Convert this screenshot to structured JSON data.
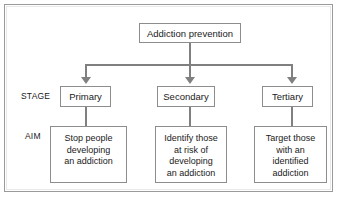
{
  "diagram": {
    "root": {
      "label": "Addiction prevention"
    },
    "row_labels": {
      "stage": "STAGE",
      "aim": "AIM"
    },
    "branches": [
      {
        "stage": "Primary",
        "aim_lines": [
          "Stop people",
          "developing",
          "an addiction"
        ]
      },
      {
        "stage": "Secondary",
        "aim_lines": [
          "Identify those",
          "at risk of",
          "developing",
          "an addiction"
        ]
      },
      {
        "stage": "Tertiary",
        "aim_lines": [
          "Target those",
          "with an",
          "identified",
          "addiction"
        ]
      }
    ],
    "colors": {
      "box_border": "#8d8d8d",
      "connector": "#808080",
      "frame_border": "#9a9a9a",
      "text": "#1a1a1a",
      "background": "#ffffff"
    }
  }
}
